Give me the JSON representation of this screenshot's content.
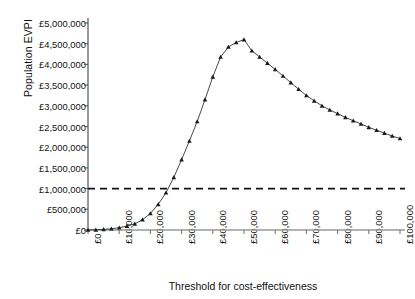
{
  "chart_data": {
    "type": "line",
    "title": "",
    "xlabel": "Threshold for cost-effectiveness",
    "ylabel": "Population EVPI",
    "xlim": [
      0,
      100000
    ],
    "ylim": [
      0,
      5000000
    ],
    "grid": false,
    "legend": null,
    "marker": "triangle",
    "line_color": "#333333",
    "xtick_labels": [
      "£0",
      "£10,000",
      "£20,000",
      "£30,000",
      "£40,000",
      "£50,000",
      "£60,000",
      "£70,000",
      "£80,000",
      "£90,000",
      "£100,000"
    ],
    "xtick_values": [
      0,
      10000,
      20000,
      30000,
      40000,
      50000,
      60000,
      70000,
      80000,
      90000,
      100000
    ],
    "ytick_labels": [
      "£0",
      "£500,000",
      "£1,000,000",
      "£1,500,000",
      "£2,000,000",
      "£2,500,000",
      "£3,000,000",
      "£3,500,000",
      "£4,000,000",
      "£4,500,000",
      "£5,000,000"
    ],
    "ytick_values": [
      0,
      500000,
      1000000,
      1500000,
      2000000,
      2500000,
      3000000,
      3500000,
      4000000,
      4500000,
      5000000
    ],
    "reference_line": {
      "label": "",
      "value": 1000000,
      "style": "dashed",
      "color": "#111111",
      "orientation": "horizontal"
    },
    "series": [
      {
        "name": "Population EVPI",
        "x": [
          0,
          2500,
          5000,
          7500,
          10000,
          12500,
          15000,
          17500,
          20000,
          22500,
          25000,
          27500,
          30000,
          32500,
          35000,
          37500,
          40000,
          42500,
          45000,
          47500,
          50000,
          52500,
          55000,
          57500,
          60000,
          62500,
          65000,
          67500,
          70000,
          72500,
          75000,
          77500,
          80000,
          82500,
          85000,
          87500,
          90000,
          92500,
          95000,
          97500,
          100000
        ],
        "y": [
          0,
          5000,
          15000,
          30000,
          55000,
          95000,
          150000,
          250000,
          400000,
          620000,
          900000,
          1270000,
          1700000,
          2150000,
          2620000,
          3150000,
          3700000,
          4180000,
          4420000,
          4530000,
          4600000,
          4330000,
          4180000,
          4030000,
          3880000,
          3720000,
          3560000,
          3400000,
          3250000,
          3120000,
          3000000,
          2900000,
          2810000,
          2720000,
          2640000,
          2560000,
          2480000,
          2410000,
          2340000,
          2270000,
          2210000
        ]
      }
    ]
  }
}
